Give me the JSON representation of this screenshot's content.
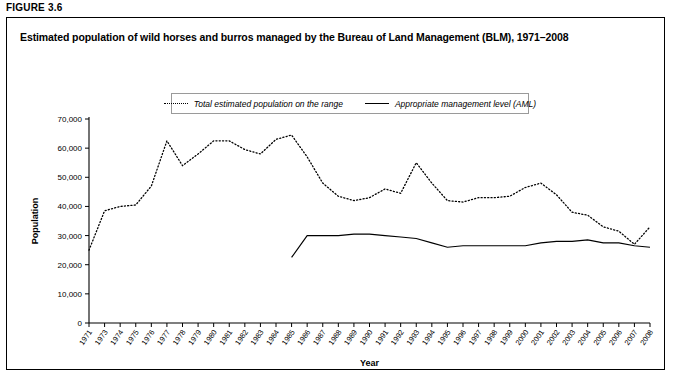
{
  "figure": {
    "label": "FIGURE 3.6",
    "title": "Estimated population of wild horses and burros managed by the Bureau of Land Management (BLM), 1971–2008"
  },
  "legend": {
    "position": "top-center",
    "items": [
      {
        "label": "Total estimated population on the range",
        "style": "dotted",
        "icon": "dotted-line-icon"
      },
      {
        "label": "Appropriate management level (AML)",
        "style": "solid",
        "icon": "solid-line-icon"
      }
    ]
  },
  "chart_data": {
    "type": "line",
    "title": "Estimated population of wild horses and burros managed by the Bureau of Land Management (BLM), 1971–2008",
    "xlabel": "Year",
    "ylabel": "Population",
    "grid": false,
    "ylim": [
      0,
      70000
    ],
    "yticks": [
      0,
      10000,
      20000,
      30000,
      40000,
      50000,
      60000,
      70000
    ],
    "ytick_labels": [
      "0",
      "10,000",
      "20,000",
      "30,000",
      "40,000",
      "50,000",
      "60,000",
      "70,000"
    ],
    "x": [
      1971,
      1973,
      1974,
      1975,
      1976,
      1977,
      1978,
      1979,
      1980,
      1981,
      1982,
      1983,
      1984,
      1985,
      1986,
      1987,
      1988,
      1989,
      1990,
      1991,
      1992,
      1993,
      1994,
      1995,
      1996,
      1997,
      1998,
      1999,
      2000,
      2001,
      2002,
      2003,
      2004,
      2005,
      2006,
      2007,
      2008
    ],
    "xtick_labels": [
      "1971",
      "1973",
      "1974",
      "1975",
      "1976",
      "1977",
      "1978",
      "1979",
      "1980",
      "1981",
      "1982",
      "1983",
      "1984",
      "1985",
      "1986",
      "1987",
      "1988",
      "1989",
      "1990",
      "1991",
      "1992",
      "1993",
      "1994",
      "1995",
      "1996",
      "1997",
      "1998",
      "1999",
      "2000",
      "2001",
      "2002",
      "2003",
      "2004",
      "2005",
      "2006",
      "2007",
      "2008"
    ],
    "series": [
      {
        "name": "Total estimated population on the range",
        "style": "dotted",
        "values": [
          25000,
          38500,
          40000,
          40500,
          47000,
          62500,
          54000,
          58000,
          62500,
          62500,
          59500,
          58000,
          63000,
          64500,
          57000,
          48000,
          43500,
          42000,
          43000,
          46000,
          44500,
          55000,
          48000,
          42000,
          41500,
          43000,
          43000,
          43500,
          46500,
          48000,
          44000,
          38000,
          37000,
          33000,
          31500,
          27000,
          33000
        ]
      },
      {
        "name": "Appropriate management level (AML)",
        "style": "solid",
        "values": [
          null,
          null,
          null,
          null,
          null,
          null,
          null,
          null,
          null,
          null,
          null,
          null,
          null,
          22500,
          30000,
          30000,
          30000,
          30500,
          30500,
          30000,
          29500,
          29000,
          27500,
          26000,
          26500,
          26500,
          26500,
          26500,
          26500,
          27500,
          28000,
          28000,
          28500,
          27500,
          27500,
          26500,
          26000
        ]
      }
    ]
  }
}
